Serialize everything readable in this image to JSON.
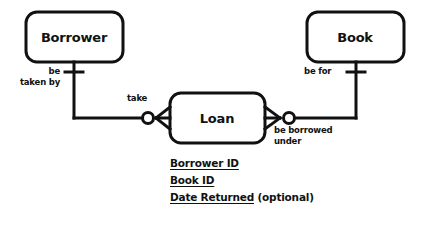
{
  "diagram": {
    "notation": "crow-foot",
    "stroke_color": "#111111",
    "fill_color": "#ffffff",
    "entities": [
      {
        "id": "borrower",
        "label": "Borrower",
        "x": 26,
        "y": 12,
        "w": 97,
        "h": 50
      },
      {
        "id": "book",
        "label": "Book",
        "x": 307,
        "y": 12,
        "w": 97,
        "h": 50
      },
      {
        "id": "loan",
        "label": "Loan",
        "x": 170,
        "y": 93,
        "w": 95,
        "h": 50
      }
    ],
    "relationships": [
      {
        "id": "borrower-loan",
        "from": "borrower",
        "to": "loan",
        "from_role": "be taken by",
        "to_role": "take",
        "from_cardinality": "one-mandatory",
        "to_cardinality": "zero-or-many"
      },
      {
        "id": "book-loan",
        "from": "book",
        "to": "loan",
        "from_role": "be for",
        "to_role": "be borrowed under",
        "from_cardinality": "one-mandatory",
        "to_cardinality": "zero-or-many"
      }
    ],
    "role_labels": [
      {
        "id": "be-taken-by",
        "lines": [
          "be",
          "taken by"
        ]
      },
      {
        "id": "take",
        "lines": [
          "take"
        ]
      },
      {
        "id": "be-for",
        "lines": [
          "be for"
        ]
      },
      {
        "id": "be-borrowed-under",
        "lines": [
          "be borrowed",
          "under"
        ]
      }
    ],
    "attributes": [
      {
        "id": "borrower-id",
        "key": "Borrower ID",
        "note": ""
      },
      {
        "id": "book-id",
        "key": "Book ID",
        "note": ""
      },
      {
        "id": "date-returned",
        "key": "Date Returned",
        "note": " (optional)"
      }
    ]
  }
}
